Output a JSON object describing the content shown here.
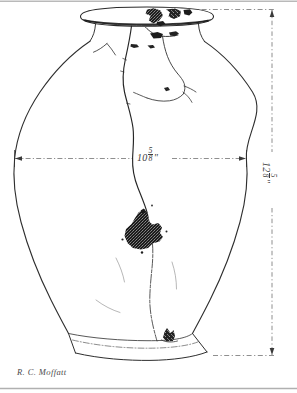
{
  "plate": {
    "subject": "ceramic storage jar",
    "medium": "pen-and-ink archaeological profile drawing",
    "background_color": "#ffffff",
    "ink_color": "#2e2e2e"
  },
  "dimensions": {
    "width_label": "10",
    "width_fraction_numerator": "5",
    "width_fraction_denominator": "8",
    "width_unit": "\"",
    "height_label": "12",
    "height_fraction_numerator": "5",
    "height_fraction_denominator": "8",
    "height_unit": "\""
  },
  "credit": {
    "signature": "R. C. Moffatt"
  },
  "features": {
    "rim": "flared everted rim with dark chipped losses",
    "neck": "short constricted neck",
    "body": "ovoid body with maximum diameter at mid-height",
    "base": "flat disc base",
    "damage": "vertical crack through center, large dark sherd loss on lower body, small dark loss at base",
    "dimension_line_style": "dashed with arrowheads"
  }
}
